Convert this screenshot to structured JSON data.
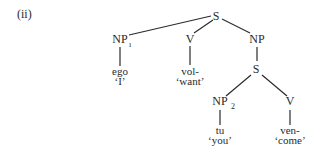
{
  "example_label": "(ii)",
  "tree": {
    "nodes": [
      {
        "id": "S_root",
        "label": "S",
        "x": 216,
        "y": 20
      },
      {
        "id": "NP1",
        "label": "NP",
        "sub": "ı",
        "x": 120,
        "y": 43
      },
      {
        "id": "V1",
        "label": "V",
        "x": 190,
        "y": 43
      },
      {
        "id": "NP_comp",
        "label": "NP",
        "x": 257,
        "y": 43
      },
      {
        "id": "S_emb",
        "label": "S",
        "x": 256,
        "y": 73
      },
      {
        "id": "NP2",
        "label": "NP",
        "sub": "2",
        "x": 220,
        "y": 105
      },
      {
        "id": "V2",
        "label": "V",
        "x": 290,
        "y": 105
      }
    ],
    "leaves": [
      {
        "parent": "NP1",
        "word": "ego",
        "gloss": "‘I’",
        "x": 120
      },
      {
        "parent": "V1",
        "word": "vol-",
        "gloss": "‘want’",
        "x": 190
      },
      {
        "parent": "NP2",
        "word": "tu",
        "gloss": "‘you’",
        "x": 220
      },
      {
        "parent": "V2",
        "word": "ven-",
        "gloss": "‘come’",
        "x": 290
      }
    ]
  }
}
